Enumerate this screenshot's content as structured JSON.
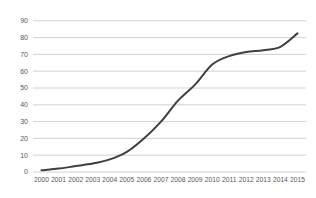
{
  "chart_data": {
    "type": "line",
    "title": "",
    "xlabel": "",
    "ylabel": "",
    "categories": [
      "2000",
      "2001",
      "2002",
      "2003",
      "2004",
      "2005",
      "2006",
      "2007",
      "2008",
      "2009",
      "2010",
      "2011",
      "2012",
      "2013",
      "2014",
      "2015"
    ],
    "values": [
      1,
      2,
      3.5,
      5,
      7.5,
      12,
      20,
      30,
      42.5,
      52,
      64,
      69,
      71.5,
      72.5,
      74.5,
      82.5
    ],
    "ylim": [
      0,
      90
    ],
    "ytick_interval": 10,
    "ytick_labels": [
      "0",
      "10",
      "20",
      "30",
      "40",
      "50",
      "60",
      "70",
      "80",
      "90"
    ],
    "grid": true,
    "grid_axis": "y",
    "legend": false,
    "smoothed": true,
    "line_color": "#3f3f3f",
    "grid_color": "#d2d2d2",
    "label_color": "#595959",
    "background_color": "#ffffff"
  }
}
